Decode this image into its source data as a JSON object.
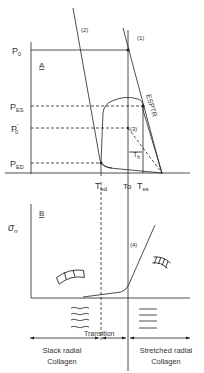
{
  "panel_a": {
    "label": "A",
    "y_labels": {
      "p0": "P",
      "p0_sub": "0",
      "pes": "P",
      "pes_sub": "ES",
      "p0prime": "P",
      "p0prime_sub": "0",
      "p0prime_sup": "'",
      "ped": "P",
      "ped_sub": "ED"
    },
    "x_labels": {
      "ted": "T",
      "ted_sub": "ed",
      "t0": "To",
      "tes": "T",
      "tes_sub": "es"
    },
    "curve_labels": {
      "line2": "(2)",
      "line1": "(1)",
      "espvr": "ESPTR",
      "point3": "(3)",
      "th": "T",
      "th_sub": "h"
    }
  },
  "panel_b": {
    "label": "B",
    "y_label": "σ",
    "y_label_sub": "rr",
    "curve_label": "(4)",
    "transition": "Transition",
    "left_region": [
      "Slack radial",
      "Collagen"
    ],
    "right_region": [
      "Stretched radial",
      "Collagen"
    ]
  },
  "colors": {
    "line": "#222222",
    "text": "#333333",
    "background": "#ffffff"
  }
}
